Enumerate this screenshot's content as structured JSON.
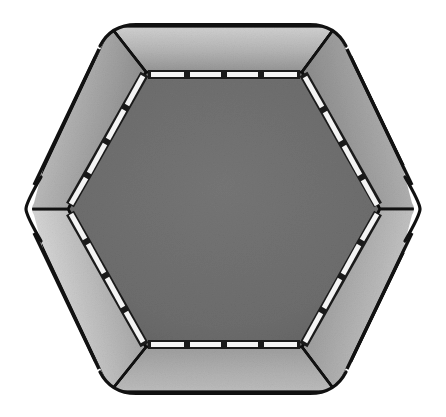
{
  "document": {
    "title": "Hexagonal Trampoline — Top View",
    "subject": "hexagonal-trampoline",
    "view": "top-down plan view",
    "style": "grayscale technical line illustration",
    "background_color": "#ffffff",
    "canvas": {
      "width": 446,
      "height": 417
    }
  },
  "palette": {
    "background": "#ffffff",
    "outline": "#111111",
    "mat_fill": "#6e6e6e",
    "mat_fill_dark": "#656565",
    "pad_light": "#c8c8c8",
    "pad_mid": "#a8a8a8",
    "pad_dark": "#7b7b7b",
    "spring_strip": "#f4f4f4",
    "spring_divider": "#1a1a1a"
  },
  "geometry": {
    "center": {
      "x": 224,
      "y": 209
    },
    "outer_hexagon": {
      "shape": "rounded-corner hexagon",
      "orientation": "flat-top",
      "corner_radius": 26,
      "vertices": [
        {
          "label": "top-left",
          "x": 110,
          "y": 26
        },
        {
          "label": "top-right",
          "x": 336,
          "y": 26
        },
        {
          "label": "right",
          "x": 424,
          "y": 209
        },
        {
          "label": "bottom-right",
          "x": 336,
          "y": 392
        },
        {
          "label": "bottom-left",
          "x": 110,
          "y": 392
        },
        {
          "label": "left",
          "x": 24,
          "y": 209
        }
      ]
    },
    "inner_hexagon": {
      "shape": "hexagon",
      "orientation": "flat-top",
      "vertices": [
        {
          "label": "top-left",
          "x": 146,
          "y": 72
        },
        {
          "label": "top-right",
          "x": 302,
          "y": 72
        },
        {
          "label": "right",
          "x": 380,
          "y": 209
        },
        {
          "label": "bottom-right",
          "x": 302,
          "y": 347
        },
        {
          "label": "bottom-left",
          "x": 146,
          "y": 347
        },
        {
          "label": "left",
          "x": 68,
          "y": 209
        }
      ]
    },
    "pad_width_px": 46
  },
  "parts": {
    "jump_mat": {
      "name": "jumping mat",
      "sides": 6,
      "fill": "#6e6e6e",
      "texture": "fine woven noise"
    },
    "safety_pad": {
      "name": "frame safety pad",
      "panel_count": 12,
      "edge_panel_count": 6,
      "corner_wedge_count": 6,
      "shading": "linear gradient, light at outer rim to dark at inner rim"
    },
    "spring_strips": {
      "name": "spring cover strips",
      "strip_color": "#f4f4f4",
      "per_edge_segments": 4,
      "edges": 6,
      "total_segments": 24,
      "divider_color": "#1a1a1a"
    }
  },
  "panels": [
    {
      "id": "panel-top",
      "type": "edge",
      "position": "top",
      "gradient_from": "#cfcfcf",
      "gradient_to": "#9a9a9a"
    },
    {
      "id": "panel-upper-right",
      "type": "edge",
      "position": "upper-right",
      "gradient_from": "#c6c6c6",
      "gradient_to": "#8e8e8e"
    },
    {
      "id": "panel-lower-right",
      "type": "edge",
      "position": "lower-right",
      "gradient_from": "#c2c2c2",
      "gradient_to": "#8a8a8a"
    },
    {
      "id": "panel-bottom",
      "type": "edge",
      "position": "bottom",
      "gradient_from": "#b8b8b8",
      "gradient_to": "#9e9e9e"
    },
    {
      "id": "panel-lower-left",
      "type": "edge",
      "position": "lower-left",
      "gradient_from": "#d2d2d2",
      "gradient_to": "#8c8c8c"
    },
    {
      "id": "panel-upper-left",
      "type": "edge",
      "position": "upper-left",
      "gradient_from": "#cbcbcb",
      "gradient_to": "#909090"
    },
    {
      "id": "wedge-top-left",
      "type": "corner",
      "position": "top-left",
      "gradient_from": "#c9c9c9",
      "gradient_to": "#949494"
    },
    {
      "id": "wedge-top-right",
      "type": "corner",
      "position": "top-right",
      "gradient_from": "#c4c4c4",
      "gradient_to": "#909090"
    },
    {
      "id": "wedge-right",
      "type": "corner",
      "position": "right",
      "gradient_from": "#c0c0c0",
      "gradient_to": "#8d8d8d"
    },
    {
      "id": "wedge-bottom-right",
      "type": "corner",
      "position": "bottom-right",
      "gradient_from": "#bcbcbc",
      "gradient_to": "#949494"
    },
    {
      "id": "wedge-bottom-left",
      "type": "corner",
      "position": "bottom-left",
      "gradient_from": "#d0d0d0",
      "gradient_to": "#969696"
    },
    {
      "id": "wedge-left",
      "type": "corner",
      "position": "left",
      "gradient_from": "#cdcdcd",
      "gradient_to": "#8f8f8f"
    }
  ],
  "caption": ""
}
